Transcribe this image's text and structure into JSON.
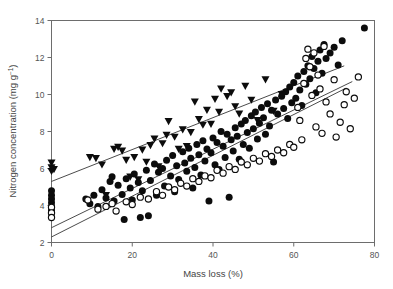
{
  "chart_data": {
    "type": "scatter",
    "title": "",
    "xlabel": "Mass loss (%)",
    "ylabel": "Nitrogen concentration (mg g-1)",
    "ylabel_base": "Nitrogen concentration (mg g",
    "ylabel_sup": "−1",
    "ylabel_close": ")",
    "xlim": [
      0,
      80
    ],
    "ylim": [
      2,
      14
    ],
    "xticks": [
      0,
      20,
      40,
      60,
      80
    ],
    "yticks": [
      2,
      4,
      6,
      8,
      10,
      12,
      14
    ],
    "xtick_labels": [
      "0",
      "20",
      "40",
      "60",
      "80"
    ],
    "ytick_labels": [
      "2",
      "4",
      "6",
      "8",
      "10",
      "12",
      "14"
    ],
    "grid": false,
    "legend": "none",
    "frame": "box",
    "colors": {
      "marker_fill": "#0c0c0c",
      "marker_open_face": "#ffffff",
      "line": "#2b2b2b",
      "axis": "#6d6d6d",
      "text": "#444444",
      "background": "#ffffff"
    },
    "series": [
      {
        "name": "triangles",
        "marker": "triangle-down",
        "fill": "solid",
        "points": [
          [
            0,
            6.3
          ],
          [
            0,
            6.05
          ],
          [
            0,
            5.85
          ],
          [
            0.6,
            5.95
          ],
          [
            9.5,
            6.6
          ],
          [
            11.0,
            6.55
          ],
          [
            12.5,
            6.2
          ],
          [
            13.5,
            4.55
          ],
          [
            15.5,
            7.05
          ],
          [
            16.5,
            7.15
          ],
          [
            17.5,
            6.95
          ],
          [
            18.5,
            6.45
          ],
          [
            19.5,
            5.55
          ],
          [
            20.5,
            6.6
          ],
          [
            21.5,
            5.4
          ],
          [
            22.5,
            7.0
          ],
          [
            23.5,
            6.35
          ],
          [
            24.5,
            7.25
          ],
          [
            25.5,
            7.6
          ],
          [
            26.5,
            6.1
          ],
          [
            27.5,
            7.35
          ],
          [
            28.5,
            7.8
          ],
          [
            29.0,
            8.55
          ],
          [
            30.5,
            7.7
          ],
          [
            31.5,
            7.05
          ],
          [
            32.5,
            8.1
          ],
          [
            33.5,
            7.2
          ],
          [
            34.5,
            7.95
          ],
          [
            35.5,
            9.6
          ],
          [
            36.5,
            8.65
          ],
          [
            37.5,
            8.35
          ],
          [
            38.5,
            9.15
          ],
          [
            39.5,
            8.4
          ],
          [
            40.5,
            9.75
          ],
          [
            41.5,
            9.05
          ],
          [
            42.0,
            10.3
          ],
          [
            43.5,
            9.9
          ],
          [
            44.5,
            10.1
          ],
          [
            45.5,
            9.35
          ],
          [
            46.5,
            8.95
          ],
          [
            48.0,
            10.45
          ],
          [
            49.5,
            9.7
          ],
          [
            51.0,
            8.6
          ],
          [
            53.0,
            10.8
          ],
          [
            55.0,
            9.1
          ],
          [
            57.0,
            10.0
          ]
        ]
      },
      {
        "name": "filled-circles",
        "marker": "circle",
        "fill": "solid",
        "points": [
          [
            0,
            4.8
          ],
          [
            0,
            4.55
          ],
          [
            0,
            4.35
          ],
          [
            0,
            4.15
          ],
          [
            0,
            3.95
          ],
          [
            0,
            3.75
          ],
          [
            8.5,
            4.35
          ],
          [
            9.5,
            4.1
          ],
          [
            10.5,
            4.55
          ],
          [
            11.5,
            3.95
          ],
          [
            12.5,
            4.85
          ],
          [
            13.5,
            4.4
          ],
          [
            14.5,
            5.3
          ],
          [
            15.0,
            5.55
          ],
          [
            15.5,
            4.25
          ],
          [
            16.5,
            5.1
          ],
          [
            17.5,
            4.6
          ],
          [
            18.0,
            3.25
          ],
          [
            18.5,
            5.45
          ],
          [
            19.5,
            4.95
          ],
          [
            20.0,
            4.3
          ],
          [
            20.5,
            5.7
          ],
          [
            21.5,
            5.25
          ],
          [
            22.0,
            3.35
          ],
          [
            22.5,
            4.8
          ],
          [
            23.5,
            5.9
          ],
          [
            24.0,
            3.45
          ],
          [
            24.5,
            5.35
          ],
          [
            25.5,
            6.25
          ],
          [
            26.0,
            4.55
          ],
          [
            26.5,
            5.8
          ],
          [
            27.5,
            6.0
          ],
          [
            28.0,
            5.05
          ],
          [
            28.5,
            6.45
          ],
          [
            29.5,
            5.6
          ],
          [
            30.0,
            6.7
          ],
          [
            30.5,
            4.75
          ],
          [
            31.0,
            6.15
          ],
          [
            31.5,
            5.4
          ],
          [
            32.5,
            6.9
          ],
          [
            33.0,
            6.3
          ],
          [
            33.5,
            5.85
          ],
          [
            34.0,
            7.1
          ],
          [
            34.5,
            6.55
          ],
          [
            35.0,
            4.95
          ],
          [
            35.5,
            6.05
          ],
          [
            36.0,
            7.3
          ],
          [
            36.5,
            6.75
          ],
          [
            37.0,
            5.65
          ],
          [
            37.5,
            7.5
          ],
          [
            38.0,
            6.4
          ],
          [
            38.5,
            7.05
          ],
          [
            39.0,
            4.25
          ],
          [
            39.5,
            6.85
          ],
          [
            40.0,
            7.65
          ],
          [
            40.5,
            6.2
          ],
          [
            41.0,
            7.4
          ],
          [
            41.5,
            5.95
          ],
          [
            42.0,
            8.0
          ],
          [
            42.5,
            7.2
          ],
          [
            43.0,
            6.6
          ],
          [
            43.5,
            7.85
          ],
          [
            44.0,
            4.45
          ],
          [
            44.5,
            7.55
          ],
          [
            45.0,
            6.95
          ],
          [
            45.5,
            8.2
          ],
          [
            46.0,
            7.75
          ],
          [
            46.5,
            6.5
          ],
          [
            47.0,
            8.4
          ],
          [
            47.5,
            7.3
          ],
          [
            48.0,
            8.6
          ],
          [
            48.5,
            7.95
          ],
          [
            49.0,
            7.1
          ],
          [
            49.5,
            8.85
          ],
          [
            50.0,
            8.15
          ],
          [
            50.5,
            9.05
          ],
          [
            51.0,
            7.6
          ],
          [
            51.5,
            8.45
          ],
          [
            52.0,
            9.3
          ],
          [
            52.5,
            8.75
          ],
          [
            53.0,
            7.85
          ],
          [
            53.5,
            9.5
          ],
          [
            54.0,
            8.3
          ],
          [
            54.5,
            9.15
          ],
          [
            55.0,
            6.35
          ],
          [
            55.5,
            9.7
          ],
          [
            56.0,
            8.95
          ],
          [
            57.0,
            9.9
          ],
          [
            57.5,
            9.25
          ],
          [
            58.0,
            10.15
          ],
          [
            58.5,
            8.7
          ],
          [
            59.0,
            10.4
          ],
          [
            59.5,
            9.55
          ],
          [
            60.0,
            10.65
          ],
          [
            60.5,
            9.8
          ],
          [
            61.0,
            11.0
          ],
          [
            61.5,
            10.25
          ],
          [
            62.0,
            9.4
          ],
          [
            62.5,
            11.25
          ],
          [
            63.0,
            10.55
          ],
          [
            63.5,
            11.55
          ],
          [
            64.0,
            10.85
          ],
          [
            64.5,
            12.05
          ],
          [
            65.0,
            11.4
          ],
          [
            65.5,
            10.1
          ],
          [
            66.0,
            11.8
          ],
          [
            66.5,
            12.4
          ],
          [
            67.0,
            11.15
          ],
          [
            67.5,
            12.7
          ],
          [
            68.0,
            11.95
          ],
          [
            69.0,
            12.25
          ],
          [
            70.0,
            12.55
          ],
          [
            71.0,
            11.6
          ],
          [
            72.0,
            12.9
          ],
          [
            77.5,
            13.6
          ]
        ]
      },
      {
        "name": "open-circles",
        "marker": "circle",
        "fill": "open",
        "points": [
          [
            0,
            3.9
          ],
          [
            0,
            3.6
          ],
          [
            0,
            3.35
          ],
          [
            9.0,
            4.3
          ],
          [
            11.5,
            3.8
          ],
          [
            13.5,
            3.95
          ],
          [
            15.0,
            4.1
          ],
          [
            16.0,
            3.7
          ],
          [
            18.5,
            4.2
          ],
          [
            20.0,
            4.05
          ],
          [
            22.0,
            4.45
          ],
          [
            24.0,
            4.35
          ],
          [
            26.0,
            4.75
          ],
          [
            27.5,
            4.55
          ],
          [
            29.0,
            5.0
          ],
          [
            30.5,
            4.85
          ],
          [
            32.0,
            5.2
          ],
          [
            33.5,
            5.05
          ],
          [
            35.0,
            5.45
          ],
          [
            36.5,
            5.3
          ],
          [
            38.0,
            5.6
          ],
          [
            39.5,
            5.5
          ],
          [
            41.0,
            5.9
          ],
          [
            42.5,
            5.75
          ],
          [
            44.0,
            6.1
          ],
          [
            45.5,
            5.95
          ],
          [
            47.0,
            6.35
          ],
          [
            48.5,
            6.2
          ],
          [
            50.0,
            6.55
          ],
          [
            51.5,
            6.4
          ],
          [
            53.0,
            6.8
          ],
          [
            54.5,
            6.65
          ],
          [
            56.0,
            7.0
          ],
          [
            57.5,
            6.85
          ],
          [
            59.0,
            7.3
          ],
          [
            60.0,
            7.15
          ],
          [
            61.0,
            9.3
          ],
          [
            61.5,
            8.6
          ],
          [
            62.0,
            7.55
          ],
          [
            62.5,
            10.6
          ],
          [
            63.0,
            11.95
          ],
          [
            63.5,
            12.45
          ],
          [
            64.0,
            11.5
          ],
          [
            64.5,
            9.95
          ],
          [
            65.0,
            12.25
          ],
          [
            65.5,
            8.25
          ],
          [
            66.0,
            11.05
          ],
          [
            66.5,
            10.3
          ],
          [
            67.0,
            7.9
          ],
          [
            67.5,
            12.6
          ],
          [
            68.0,
            9.6
          ],
          [
            69.0,
            8.95
          ],
          [
            70.0,
            10.8
          ],
          [
            70.5,
            7.7
          ],
          [
            71.5,
            8.5
          ],
          [
            72.5,
            9.45
          ],
          [
            73.0,
            10.15
          ],
          [
            74.0,
            8.15
          ],
          [
            75.0,
            9.8
          ],
          [
            76.0,
            10.95
          ]
        ]
      }
    ],
    "fit_lines": [
      {
        "name": "upper-line",
        "x": [
          0,
          72.5
        ],
        "y": [
          5.3,
          11.55
        ]
      },
      {
        "name": "middle-line",
        "x": [
          0,
          74.5
        ],
        "y": [
          2.8,
          10.7
        ]
      },
      {
        "name": "lower-line",
        "x": [
          0,
          73.0
        ],
        "y": [
          2.3,
          10.35
        ]
      }
    ]
  }
}
